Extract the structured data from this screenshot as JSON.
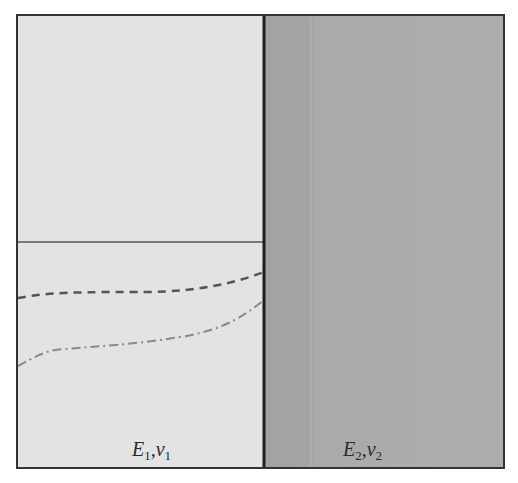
{
  "diagram": {
    "type": "bimaterial-schematic",
    "frame": {
      "x": 17,
      "y": 15,
      "width": 487,
      "height": 453,
      "stroke": "#333333"
    },
    "materials": [
      {
        "id": "material-1",
        "symbol": "E",
        "subscript": "1",
        "symbol2": "ν",
        "subscript2": "1",
        "label": "E1, ν1",
        "fill": "#e3e3e3",
        "region": {
          "x": 17,
          "y": 15,
          "width": 247,
          "height": 453
        }
      },
      {
        "id": "material-2",
        "symbol": "E",
        "subscript": "2",
        "symbol2": "ν",
        "subscript2": "2",
        "label": "E2, ν2",
        "fill": "#a9a9a9",
        "region": {
          "x": 264,
          "y": 15,
          "width": 240,
          "height": 453
        }
      }
    ],
    "interface_line": {
      "x": 264,
      "stroke": "#1e1e1e",
      "width": 3
    },
    "lines": [
      {
        "name": "solid-horizontal-line",
        "style": "solid",
        "color": "#555555",
        "points": [
          [
            17,
            242
          ],
          [
            264,
            242
          ]
        ]
      },
      {
        "name": "dashed-curve",
        "style": "dashed",
        "color": "#555555",
        "path": "M18,298 C50,292 80,292 150,292 C200,291 235,283 264,272"
      },
      {
        "name": "dash-dot-curve",
        "style": "dash-dot",
        "color": "#888888",
        "path": "M18,366 C35,357 45,350 65,349 C100,346 130,345 180,337 C225,330 245,315 264,300"
      }
    ]
  }
}
